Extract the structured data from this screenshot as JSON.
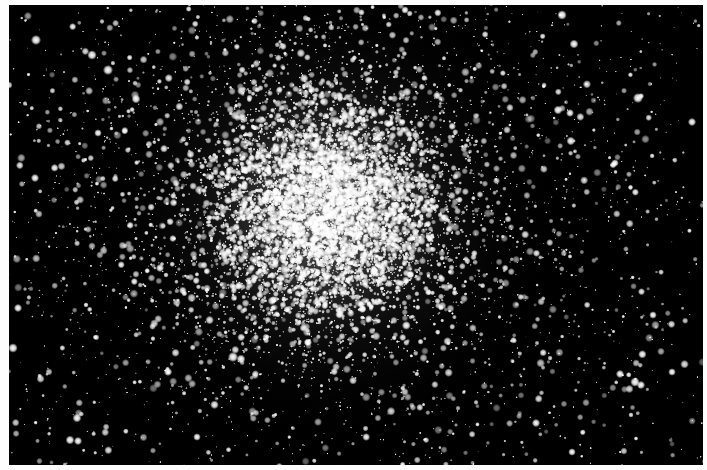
{
  "image": {
    "subject": "globular star cluster",
    "description": "Black-and-white astronomical photograph of a dense globular star cluster with a bright, crowded core fading into scattered field stars",
    "width": 707,
    "height": 470,
    "colors": {
      "border": "#fdfdfd",
      "sky": "#000000",
      "star": "#ffffff",
      "core_glow": "#d8d8d8"
    },
    "photo_area": {
      "x": 9,
      "y": 5,
      "width": 694,
      "height": 460
    },
    "cluster": {
      "center_x": 326,
      "center_y": 210,
      "core_sigma": 55,
      "halo_sigma": 150,
      "core_stars": 5200,
      "halo_stars": 3400,
      "field_stars": 900,
      "seed": 1337
    },
    "bright_field_stars": [
      [
        36,
        40,
        3.2
      ],
      [
        92,
        55,
        3.0
      ],
      [
        108,
        70,
        3.2
      ],
      [
        136,
        99,
        2.8
      ],
      [
        35,
        178,
        2.6
      ],
      [
        98,
        133,
        2.4
      ],
      [
        562,
        15,
        3.0
      ],
      [
        574,
        44,
        2.8
      ],
      [
        638,
        98,
        3.2
      ],
      [
        692,
        122,
        2.6
      ],
      [
        558,
        110,
        2.8
      ],
      [
        570,
        113,
        2.5
      ],
      [
        13,
        348,
        3.0
      ],
      [
        77,
        418,
        2.8
      ],
      [
        70,
        440,
        2.8
      ],
      [
        78,
        441,
        2.6
      ],
      [
        233,
        357,
        3.2
      ],
      [
        241,
        359,
        2.8
      ],
      [
        635,
        382,
        3.0
      ],
      [
        641,
        385,
        2.6
      ],
      [
        620,
        374,
        2.6
      ],
      [
        672,
        372,
        2.4
      ],
      [
        536,
        423,
        2.6
      ],
      [
        572,
        452,
        2.4
      ],
      [
        18,
        308,
        2.6
      ],
      [
        160,
        268,
        2.6
      ],
      [
        405,
        10,
        2.4
      ],
      [
        615,
        163,
        2.4
      ],
      [
        653,
        315,
        2.4
      ],
      [
        197,
        437,
        2.4
      ]
    ]
  }
}
